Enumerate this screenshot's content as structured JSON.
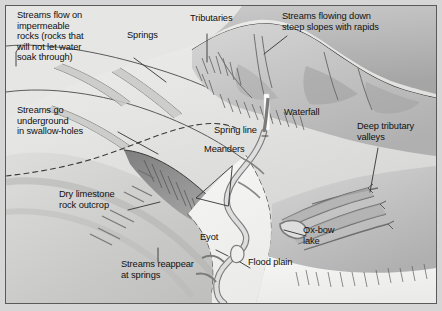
{
  "diagram": {
    "type": "geographical-cross-landscape-illustration",
    "palette": {
      "page_background": "#d6d6d6",
      "frame_border": "#5a5a5a",
      "lowland_light": "#ececeb",
      "flood_plain": "#f2f2f0",
      "upland_mid": "#c2c2c2",
      "upland_dark": "#a9a9a9",
      "scarp_dark": "#8d8d8d",
      "river_fill": "#dedede",
      "river_stroke": "#7b7b7b",
      "waterfall_white": "#fdfdfd",
      "label_text": "#111111",
      "leader_line": "#333333",
      "dashed_spring_line": "#3a3a3a"
    },
    "labels": [
      {
        "id": "impermeable-rocks",
        "text": "Streams flow on\nimpermeable\nrocks (rocks that\nwill not let water\nsoak through)",
        "x": 16,
        "y": 9,
        "align": "left"
      },
      {
        "id": "springs",
        "text": "Springs",
        "x": 126,
        "y": 29,
        "align": "left"
      },
      {
        "id": "tributaries",
        "text": "Tributaries",
        "x": 189,
        "y": 12,
        "align": "left"
      },
      {
        "id": "steep-slopes-rapids",
        "text": "Streams flowing down\nsteep slopes with rapids",
        "x": 281,
        "y": 10,
        "align": "left"
      },
      {
        "id": "swallow-holes",
        "text": "Streams go\nunderground\nin swallow-holes",
        "x": 16,
        "y": 104,
        "align": "left"
      },
      {
        "id": "waterfall",
        "text": "Waterfall",
        "x": 283,
        "y": 106,
        "align": "left"
      },
      {
        "id": "spring-line",
        "text": "Spring line",
        "x": 213,
        "y": 124,
        "align": "left"
      },
      {
        "id": "deep-tributary",
        "text": "Deep tributary\nvalleys",
        "x": 356,
        "y": 120,
        "align": "left"
      },
      {
        "id": "meanders",
        "text": "Meanders",
        "x": 203,
        "y": 143,
        "align": "left"
      },
      {
        "id": "dry-limestone",
        "text": "Dry limestone\nrock outcrop",
        "x": 58,
        "y": 188,
        "align": "left"
      },
      {
        "id": "eyot",
        "text": "Eyot",
        "x": 199,
        "y": 231,
        "align": "left"
      },
      {
        "id": "ox-bow-lake",
        "text": "Ox-bow\nlake",
        "x": 302,
        "y": 224,
        "align": "left"
      },
      {
        "id": "streams-reappear",
        "text": "Streams reappear\nat springs",
        "x": 120,
        "y": 258,
        "align": "left"
      },
      {
        "id": "flood-plain",
        "text": "Flood plain",
        "x": 247,
        "y": 256,
        "align": "left"
      }
    ],
    "features": [
      {
        "name": "impermeable-upland",
        "description": "High ground of impermeable rock in the upper left and top"
      },
      {
        "name": "spring-line-boundary",
        "description": "Dashed geological boundary where springs emerge"
      },
      {
        "name": "limestone-scarp",
        "description": "Dark triangular dry limestone escarpment in the centre"
      },
      {
        "name": "waterfall",
        "description": "White vertical fall on the upland river course"
      },
      {
        "name": "meandering-river",
        "description": "Main river meandering south across the flood plain"
      },
      {
        "name": "ox-bow-lake",
        "description": "Abandoned meander loop cut off from the river"
      },
      {
        "name": "eyot",
        "description": "Small island within the river channel"
      },
      {
        "name": "flood-plain",
        "description": "Flat pale lowland either side of the meandering river"
      },
      {
        "name": "deep-tributary-valleys",
        "description": "Steep-sided valleys converging from the right uplands"
      }
    ]
  }
}
